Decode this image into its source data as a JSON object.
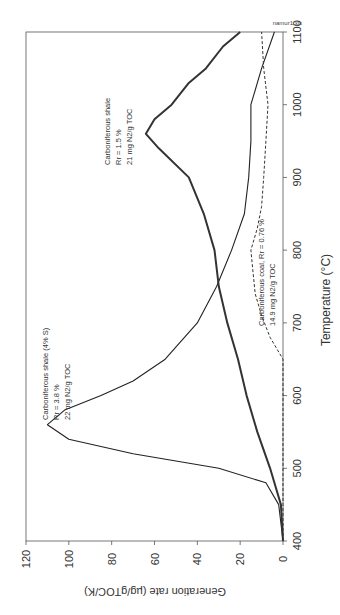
{
  "source_label": "namur1.xls",
  "chart_data": {
    "type": "line",
    "title": "",
    "xlabel": "Temperature (°C)",
    "ylabel": "Generation rate (µg/gTOC/K)",
    "xlim": [
      400,
      1100
    ],
    "ylim": [
      0,
      120
    ],
    "x_ticks": [
      400,
      500,
      600,
      700,
      800,
      900,
      1000,
      1100
    ],
    "y_ticks": [
      0,
      20,
      40,
      60,
      80,
      100,
      120
    ],
    "grid": false,
    "orientation": "rotated 90° clockwise (temperature axis vertical on right, generation rate horizontal along bottom)",
    "series": [
      {
        "name": "Carboniferous shale (4% S)",
        "annotation": [
          "Carboniferous shale (4% S)",
          "Rr = 3.8 %",
          "22 mg N2/g TOC"
        ],
        "style": "solid-thin",
        "x": [
          400,
          450,
          480,
          500,
          520,
          540,
          560,
          580,
          600,
          620,
          650,
          700,
          750,
          800,
          850,
          900,
          950,
          1000,
          1050,
          1100
        ],
        "values": [
          0,
          2,
          8,
          30,
          70,
          100,
          110,
          102,
          85,
          70,
          55,
          40,
          31,
          24,
          18,
          16,
          15,
          15,
          10,
          4
        ]
      },
      {
        "name": "Carboniferous shale",
        "annotation": [
          "Carboniferous shale",
          "Rr = 1.5 %",
          "21 mg N2/g TOC"
        ],
        "style": "solid-thick",
        "x": [
          400,
          450,
          480,
          500,
          550,
          600,
          650,
          700,
          750,
          800,
          850,
          900,
          940,
          960,
          980,
          1000,
          1030,
          1050,
          1080,
          1100
        ],
        "values": [
          0,
          1,
          4,
          6,
          12,
          17,
          21,
          26,
          30,
          32,
          37,
          44,
          58,
          64,
          60,
          52,
          44,
          36,
          28,
          20
        ]
      },
      {
        "name": "Carboniferous coal",
        "annotation": [
          "Carboniferous coal, Rr = 0.76 %",
          "14.9 mg N2/g TOC"
        ],
        "style": "dashed",
        "x": [
          400,
          450,
          650,
          680,
          710,
          740,
          770,
          800,
          830,
          860,
          900,
          950,
          1000,
          1050,
          1100
        ],
        "values": [
          0,
          0,
          0,
          6,
          10,
          13,
          14,
          15,
          12,
          10,
          9,
          8,
          7,
          9,
          10
        ]
      }
    ]
  },
  "axis_labels": {
    "x": "Temperature (°C)",
    "y": "Generation rate (µg/gTOC/K)"
  },
  "annotations": {
    "shale_4s": {
      "line1": "Carboniferous shale (4% S)",
      "line2": "Rr = 3.8 %",
      "line3": "22 mg N2/g TOC"
    },
    "shale_15": {
      "line1": "Carboniferous shale",
      "line2": "Rr = 1.5 %",
      "line3": "21 mg N2/g TOC"
    },
    "coal": {
      "line1": "Carboniferous coal, Rr = 0.76 %",
      "line2": "14.9 mg N2/g TOC"
    }
  }
}
